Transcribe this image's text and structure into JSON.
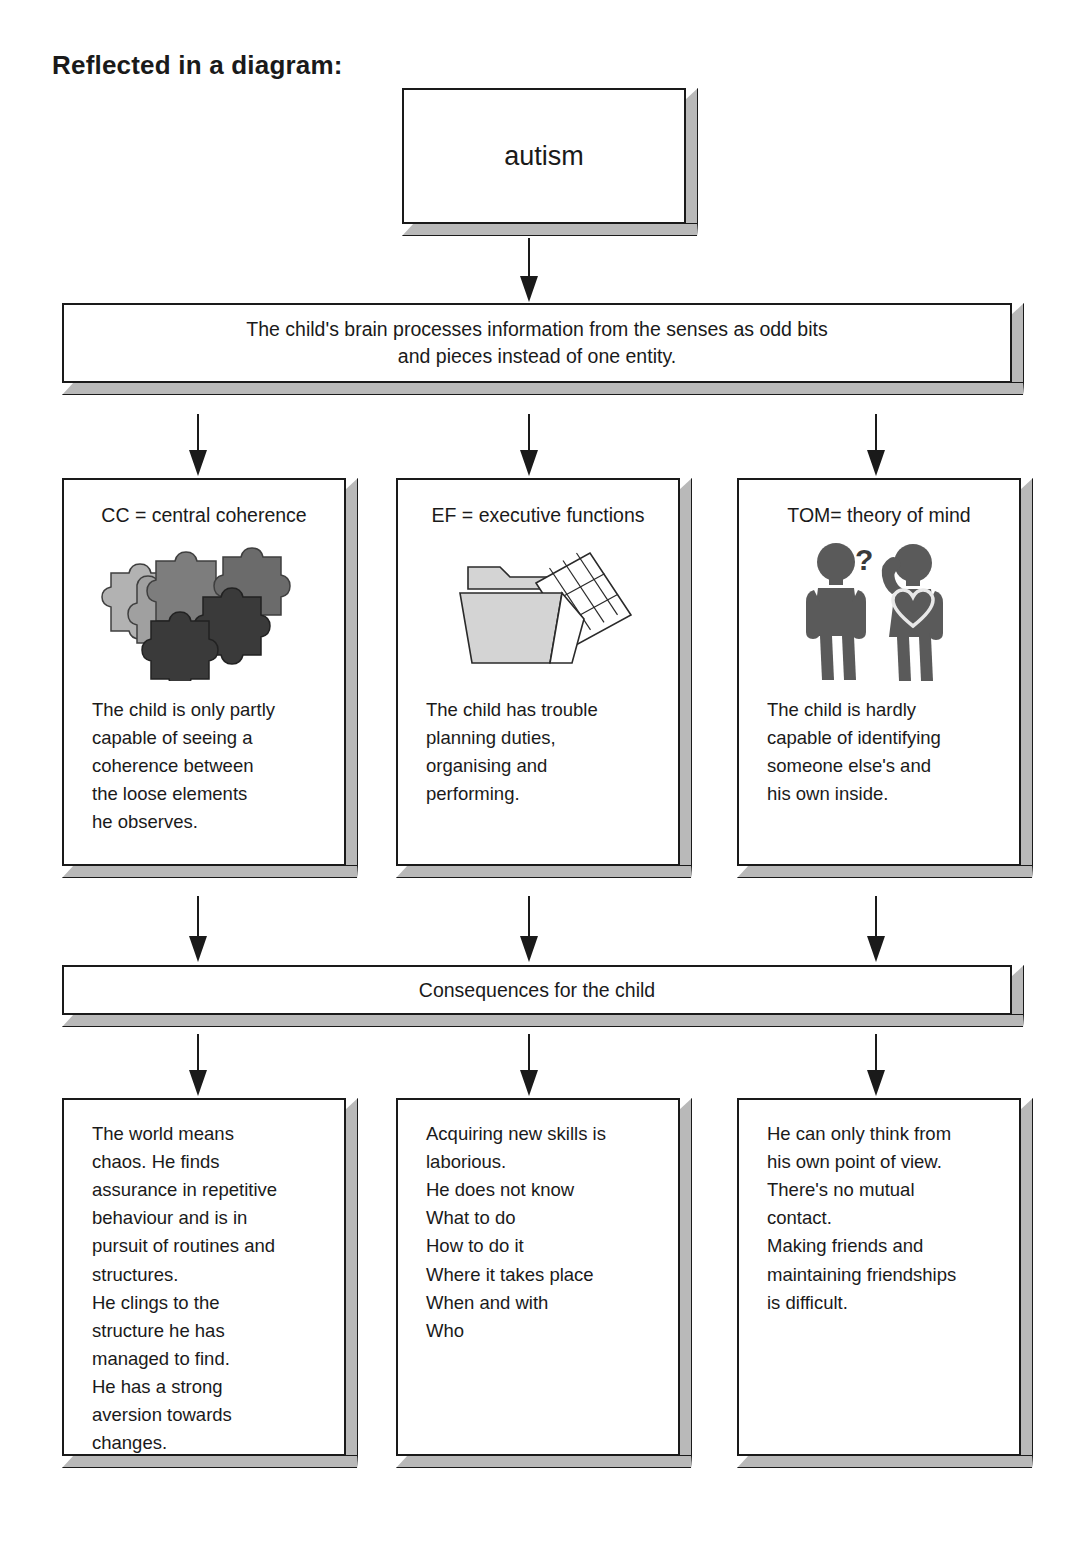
{
  "title": "Reflected in a diagram:",
  "nodes": {
    "root": {
      "label": "autism"
    },
    "senses": {
      "label": "The child's brain processes information from the senses as odd bits\nand pieces instead of one entity."
    },
    "consequences": {
      "label": "Consequences for the child"
    }
  },
  "theories": [
    {
      "key": "cc",
      "title": "CC = central coherence",
      "icon": "puzzle-pieces-icon",
      "body": "The child is only partly\ncapable of seeing a\ncoherence between\nthe loose elements\nhe observes."
    },
    {
      "key": "ef",
      "title": "EF = executive functions",
      "icon": "folder-schedule-icon",
      "body": "The child has trouble\nplanning duties,\norganising and\nperforming."
    },
    {
      "key": "tom",
      "title": "TOM= theory of mind",
      "icon": "two-people-icon",
      "body": "The child is hardly\ncapable of identifying\nsomeone else's and\nhis own inside."
    }
  ],
  "outcomes": [
    {
      "key": "c1",
      "body": "The world means\nchaos. He finds\nassurance in repetitive\nbehaviour and is in\npursuit of routines and\nstructures.\nHe clings to the\nstructure he has\nmanaged to find.\nHe has a strong\naversion towards\nchanges."
    },
    {
      "key": "c2",
      "body": "Acquiring new skills is\nlaborious.\nHe does not know\nWhat to do\nHow to do it\nWhere it takes place\nWhen and with\nWho"
    },
    {
      "key": "c3",
      "body": "He can only think from\nhis own point of view.\nThere's no mutual\ncontact.\nMaking friends and\nmaintaining friendships\nis difficult."
    }
  ],
  "colors": {
    "ink": "#1a1a1a",
    "paper": "#ffffff",
    "bevel": "#b9b9b9",
    "puzzle_light": "#b2b2b2",
    "puzzle_light_mid": "#a0a0a0",
    "puzzle_mid": "#7d7d7d",
    "puzzle_dark": "#6b6b6b",
    "puzzle_darkest": "#3a3a3a",
    "folder_fill": "#d4d4d4",
    "people_fill": "#5a5a5a"
  }
}
